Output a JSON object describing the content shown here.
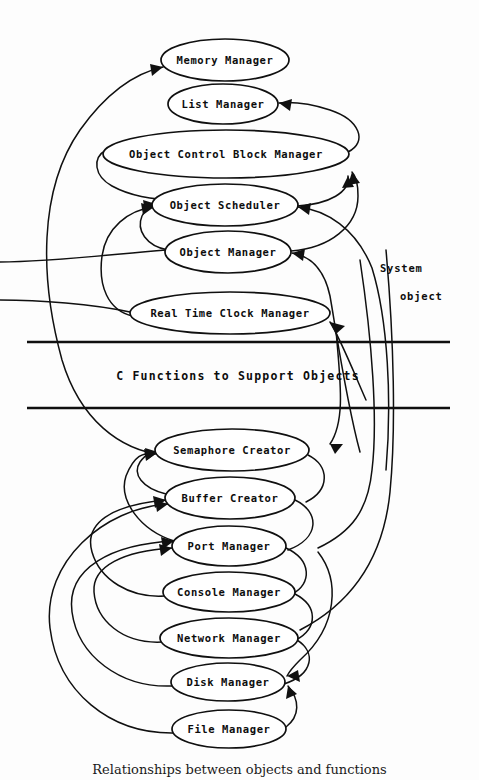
{
  "figure": {
    "caption": "Relationships between objects and functions",
    "background_color": "#fdfdfd",
    "ink_color": "#101010"
  },
  "layers": {
    "system_object_label": {
      "line1": "System",
      "line2": "object"
    },
    "middle_band": {
      "label": "C Functions to Support Objects",
      "rule_top_y": 342,
      "rule_bottom_y": 408
    }
  },
  "nodes": [
    {
      "id": "memory-manager",
      "label": "Memory Manager",
      "cx": 225,
      "cy": 60,
      "rx": 64,
      "ry": 21,
      "font_size": 10.5
    },
    {
      "id": "list-manager",
      "label": "List Manager",
      "cx": 223,
      "cy": 104,
      "rx": 55,
      "ry": 20,
      "font_size": 10.5
    },
    {
      "id": "object-control-block-manager",
      "label": "Object Control Block Manager",
      "cx": 226,
      "cy": 154,
      "rx": 123,
      "ry": 24,
      "font_size": 10.5
    },
    {
      "id": "object-scheduler",
      "label": "Object Scheduler",
      "cx": 225,
      "cy": 205,
      "rx": 73,
      "ry": 21,
      "font_size": 10.5
    },
    {
      "id": "object-manager",
      "label": "Object Manager",
      "cx": 228,
      "cy": 252,
      "rx": 63,
      "ry": 21,
      "font_size": 10.5
    },
    {
      "id": "real-time-clock-manager",
      "label": "Real Time Clock Manager",
      "cx": 230,
      "cy": 313,
      "rx": 100,
      "ry": 21,
      "font_size": 10.5
    },
    {
      "id": "semaphore-creator",
      "label": "Semaphore Creator",
      "cx": 232,
      "cy": 450,
      "rx": 77,
      "ry": 21,
      "font_size": 10.5
    },
    {
      "id": "buffer-creator",
      "label": "Buffer Creator",
      "cx": 230,
      "cy": 498,
      "rx": 65,
      "ry": 21,
      "font_size": 10.5
    },
    {
      "id": "port-manager",
      "label": "Port Manager",
      "cx": 229,
      "cy": 546,
      "rx": 57,
      "ry": 20,
      "font_size": 10.5
    },
    {
      "id": "console-manager",
      "label": "Console Manager",
      "cx": 229,
      "cy": 592,
      "rx": 66,
      "ry": 20,
      "font_size": 10.5
    },
    {
      "id": "network-manager",
      "label": "Network Manager",
      "cx": 229,
      "cy": 638,
      "rx": 69,
      "ry": 20,
      "font_size": 10.5
    },
    {
      "id": "disk-manager",
      "label": "Disk Manager",
      "cx": 228,
      "cy": 682,
      "rx": 57,
      "ry": 19,
      "font_size": 10.5
    },
    {
      "id": "file-manager",
      "label": "File Manager",
      "cx": 229,
      "cy": 729,
      "rx": 57,
      "ry": 19,
      "font_size": 10.5
    }
  ],
  "edges": [
    {
      "id": "edge-file-to-disk",
      "from": "file-manager",
      "to": "disk-manager"
    },
    {
      "id": "edge-disk-to-port",
      "from": "disk-manager",
      "to": "port-manager"
    },
    {
      "id": "edge-network-to-port",
      "from": "network-manager",
      "to": "port-manager"
    },
    {
      "id": "edge-console-to-buffer",
      "from": "console-manager",
      "to": "buffer-creator"
    },
    {
      "id": "edge-port-to-buffer",
      "from": "port-manager",
      "to": "buffer-creator"
    },
    {
      "id": "edge-buffer-to-semaphore",
      "from": "buffer-creator",
      "to": "semaphore-creator"
    },
    {
      "id": "edge-semaphore-to-memory",
      "from": "semaphore-creator",
      "to": "memory-manager"
    },
    {
      "id": "edge-semaphore-to-object-scheduler",
      "from": "semaphore-creator",
      "to": "object-scheduler"
    },
    {
      "id": "edge-rtc-to-object-scheduler",
      "from": "real-time-clock-manager",
      "to": "object-scheduler"
    },
    {
      "id": "edge-object-manager-to-ocb",
      "from": "object-manager",
      "to": "object-control-block-manager"
    },
    {
      "id": "edge-object-scheduler-to-ocb",
      "from": "object-scheduler",
      "to": "object-control-block-manager"
    },
    {
      "id": "edge-ocb-to-list",
      "from": "object-control-block-manager",
      "to": "list-manager"
    },
    {
      "id": "edge-system-to-object-manager",
      "from": "system-object",
      "to": "object-manager"
    },
    {
      "id": "edge-system-to-semaphore",
      "from": "system-object",
      "to": "semaphore-creator"
    }
  ]
}
